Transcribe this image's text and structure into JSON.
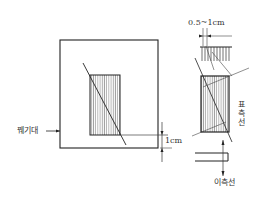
{
  "labels": {
    "left_pointer": "꿰기대",
    "margin_1cm": "1cm",
    "top_range": "0.5~1cm",
    "right_vertical": "표측선",
    "bottom_label": "이측선"
  },
  "colors": {
    "line": "#222222",
    "hatch": "#555555",
    "background": "#ffffff"
  }
}
